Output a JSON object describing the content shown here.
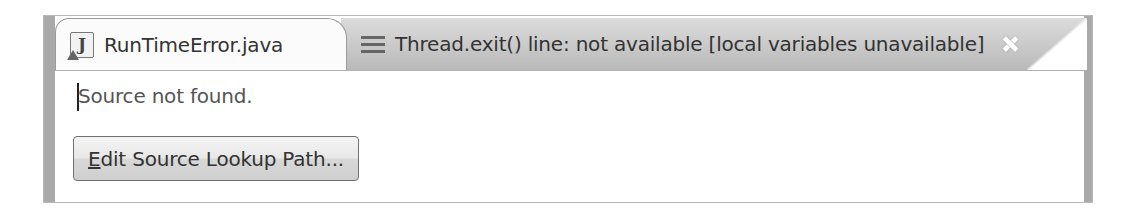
{
  "editor": {
    "tabs": [
      {
        "label": "RunTimeError.java",
        "icon": "java-file-icon",
        "active": false
      },
      {
        "label": "Thread.exit() line: not available [local variables unavailable]",
        "icon": "stack-frame-icon",
        "active": true,
        "closable": true
      }
    ],
    "message": "Source not found.",
    "button": {
      "mnemonic": "E",
      "label_rest": "dit Source Lookup Path...",
      "full_label": "Edit Source Lookup Path..."
    }
  }
}
